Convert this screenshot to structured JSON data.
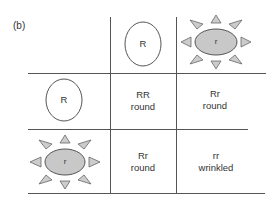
{
  "figure_label": "(b)",
  "header_row": {
    "alleles": [
      {
        "symbol": "R",
        "shape": "round-seed"
      },
      {
        "symbol": "r",
        "shape": "wrinkled-seed"
      }
    ]
  },
  "header_col": {
    "alleles": [
      {
        "symbol": "R",
        "shape": "round-seed"
      },
      {
        "symbol": "r",
        "shape": "wrinkled-seed"
      }
    ]
  },
  "cells": [
    [
      {
        "genotype": "RR",
        "phenotype": "round"
      },
      {
        "genotype": "Rr",
        "phenotype": "round"
      }
    ],
    [
      {
        "genotype": "Rr",
        "phenotype": "round"
      },
      {
        "genotype": "rr",
        "phenotype": "wrinkled"
      }
    ]
  ],
  "colors": {
    "line": "#555555",
    "wrinkled_fill": "#c8c8c8",
    "outline": "#555555"
  }
}
